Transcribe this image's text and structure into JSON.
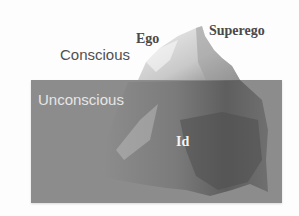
{
  "diagram": {
    "colors": {
      "background": "#fdfdfd",
      "water": "#8c8c8c",
      "ice_light": "#e4e4e4",
      "ice_mid": "#bdbdbd",
      "ice_dark": "#5e5e5e",
      "label_dark": "#4a4a4a",
      "label_light": "#e6e6e6"
    },
    "zones": {
      "above_water": "Conscious",
      "below_water": "Unconscious"
    },
    "parts": {
      "ego": "Ego",
      "superego": "Superego",
      "id": "Id"
    }
  }
}
